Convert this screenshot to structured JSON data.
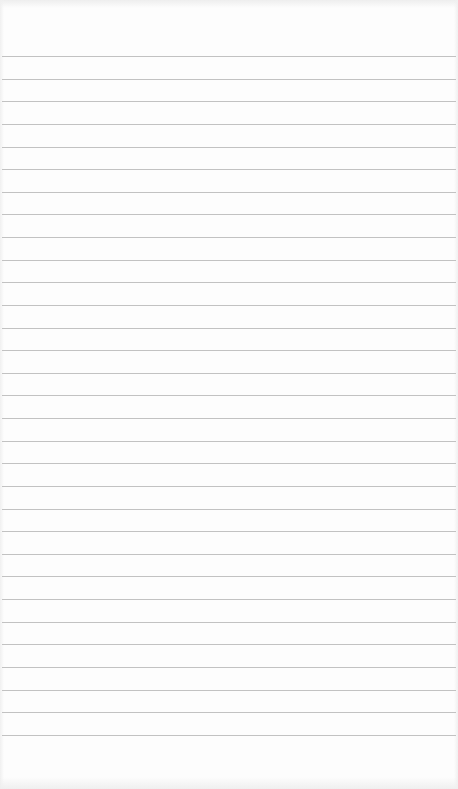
{
  "page": {
    "type": "lined-paper",
    "background_color": "#fdfdfd",
    "line_color": "#c2c2c2",
    "line_count": 31,
    "first_line_y": 56,
    "line_spacing": 22.63
  }
}
